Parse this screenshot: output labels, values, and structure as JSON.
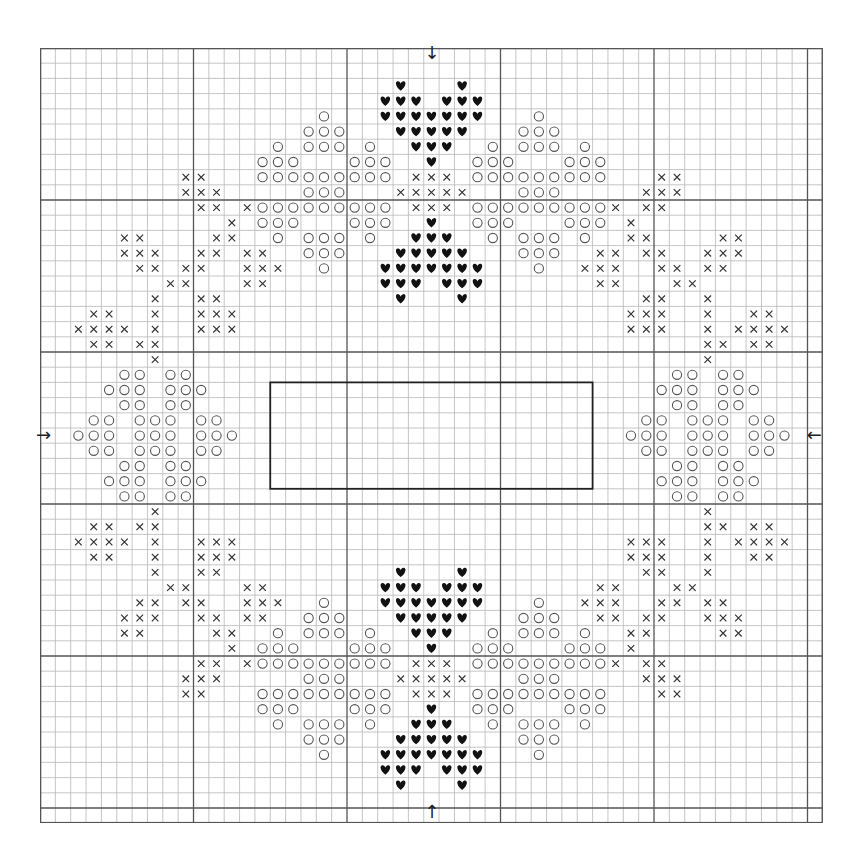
{
  "chart": {
    "title": "",
    "type": "cross-stitch-pattern",
    "columns": 51,
    "rows": 51,
    "cell_width": 15.35,
    "cell_height": 15.2,
    "major_line_every": 10,
    "center": {
      "col": 25,
      "row": 25
    },
    "symmetry": "four-way (mirrored horizontally and vertically about center)",
    "colors": {
      "grid_minor": "#b8b8b8",
      "grid_major": "#555555",
      "border": "#555555",
      "symbol": "#111111",
      "circle": "#555555",
      "cross": "#333333",
      "frame": "#222222"
    },
    "legend": {
      "heart": "heart-symbol",
      "circle": "circle-symbol",
      "cross": "cross-symbol"
    },
    "center_arrows": {
      "top": "↓",
      "bottom": "↑",
      "left": "→",
      "right": "←"
    },
    "frame_rectangle": {
      "col_start": 15,
      "col_end": 35,
      "row_start": 22,
      "row_end": 28
    },
    "quadrant": {
      "hearts": {
        "2": [
          23
        ],
        "3": [
          22,
          23,
          24
        ],
        "4": [
          22,
          23,
          24,
          25
        ],
        "5": [
          23,
          24,
          25
        ],
        "6": [
          24,
          25
        ],
        "7": [
          25
        ],
        "11": [
          25
        ],
        "12": [
          24,
          25
        ],
        "13": [
          23,
          24,
          25
        ],
        "14": [
          22,
          23,
          24,
          25
        ],
        "15": [
          22,
          23,
          24
        ],
        "16": [
          23
        ]
      },
      "circles": {
        "4": [
          18
        ],
        "5": [
          17,
          18,
          19
        ],
        "6": [
          15,
          17,
          18,
          19,
          21
        ],
        "7": [
          14,
          15,
          16,
          20,
          21,
          22
        ],
        "8": [
          14,
          15,
          16,
          17,
          18,
          19,
          20,
          21,
          22
        ],
        "9": [
          17,
          18,
          19
        ],
        "10": [
          14,
          15,
          16,
          17,
          18,
          19,
          20,
          21,
          22
        ],
        "11": [
          14,
          15,
          16,
          20,
          21,
          22
        ],
        "12": [
          15,
          17,
          18,
          19,
          21
        ],
        "13": [
          17,
          18,
          19
        ],
        "14": [
          18
        ],
        "21": [
          5,
          6,
          8,
          9
        ],
        "22": [
          4,
          5,
          6,
          8,
          9,
          10
        ],
        "23": [
          5,
          6,
          8,
          9
        ],
        "24": [
          3,
          4,
          6,
          7,
          8,
          10,
          11
        ],
        "25": [
          2,
          3,
          4,
          6,
          7,
          8,
          10,
          11,
          12
        ]
      },
      "crosses": {
        "8": [
          9,
          10,
          24,
          25
        ],
        "9": [
          9,
          10,
          11,
          23,
          24,
          25
        ],
        "10": [
          10,
          11,
          13,
          24,
          25
        ],
        "11": [
          12
        ],
        "12": [
          5,
          6,
          11,
          12
        ],
        "13": [
          5,
          6,
          7,
          10,
          11,
          13,
          14
        ],
        "14": [
          6,
          7,
          9,
          10,
          13,
          14,
          15
        ],
        "15": [
          8,
          9,
          13,
          14
        ],
        "16": [
          7,
          10,
          11
        ],
        "17": [
          3,
          4,
          7,
          10,
          11,
          12
        ],
        "18": [
          2,
          3,
          4,
          5,
          7,
          10,
          11,
          12
        ],
        "19": [
          3,
          4,
          6,
          7
        ],
        "20": [
          7
        ]
      }
    }
  }
}
